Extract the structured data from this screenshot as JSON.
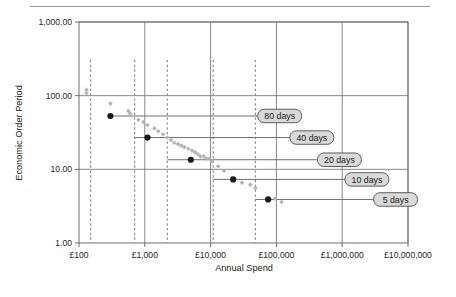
{
  "figure": {
    "name": "economic-order-period-chart",
    "top_rule": true,
    "background": "#ffffff"
  },
  "chart_data": {
    "type": "scatter",
    "title": "",
    "xlabel": "Annual Spend",
    "ylabel": "Economic Order Period",
    "xscale": "log",
    "yscale": "log",
    "xlim": [
      100,
      10000000
    ],
    "ylim": [
      1,
      1000
    ],
    "grid": true,
    "legend": "none",
    "xticks": [
      100,
      1000,
      10000,
      100000,
      1000000,
      10000000
    ],
    "xticklabels": [
      "£100",
      "£1,000",
      "£10,000",
      "£100,000",
      "£1,000,000",
      "£10,000,000"
    ],
    "yticks": [
      1,
      10,
      100,
      1000
    ],
    "yticklabels": [
      "1.00",
      "10.00",
      "100.00",
      "1,000.00"
    ],
    "series": [
      {
        "name": "Item scatter (grey diamonds)",
        "marker": "diamond",
        "color": "#b3b3b3",
        "points": [
          [
            130,
            120
          ],
          [
            130,
            108
          ],
          [
            300,
            78
          ],
          [
            560,
            62
          ],
          [
            600,
            57
          ],
          [
            800,
            47
          ],
          [
            950,
            44
          ],
          [
            1100,
            40
          ],
          [
            1400,
            36
          ],
          [
            1600,
            33
          ],
          [
            1900,
            30
          ],
          [
            2200,
            27
          ],
          [
            2500,
            25
          ],
          [
            2800,
            23
          ],
          [
            3200,
            22
          ],
          [
            3600,
            21
          ],
          [
            4000,
            20
          ],
          [
            4600,
            19
          ],
          [
            5200,
            18
          ],
          [
            5800,
            17
          ],
          [
            6400,
            16
          ],
          [
            7000,
            15
          ],
          [
            7800,
            15
          ],
          [
            8600,
            14
          ],
          [
            9500,
            14
          ],
          [
            10500,
            13
          ],
          [
            13000,
            11
          ],
          [
            16000,
            9.6
          ],
          [
            30000,
            6.6
          ],
          [
            40000,
            6.2
          ],
          [
            48000,
            5.6
          ],
          [
            95000,
            4.0
          ],
          [
            120000,
            3.6
          ]
        ]
      },
      {
        "name": "Break-point markers (black circles)",
        "marker": "circle",
        "color": "#1a1a1a",
        "points": [
          [
            300,
            53
          ],
          [
            1100,
            27
          ],
          [
            5000,
            13.5
          ],
          [
            22000,
            7.3
          ],
          [
            75000,
            3.9
          ]
        ]
      }
    ],
    "callouts": [
      {
        "label": "80 days",
        "y_value": 53,
        "leader_from_x": 300,
        "leader_to_x": 52000
      },
      {
        "label": "40 days",
        "y_value": 27,
        "leader_from_x": 700,
        "leader_to_x": 160000
      },
      {
        "label": "20 days",
        "y_value": 13.5,
        "leader_from_x": 2200,
        "leader_to_x": 420000
      },
      {
        "label": "10 days",
        "y_value": 7.3,
        "leader_from_x": 11000,
        "leader_to_x": 1100000
      },
      {
        "label": "5 days",
        "y_value": 3.9,
        "leader_from_x": 48000,
        "leader_to_x": 3000000
      }
    ],
    "threshold_lines": [
      {
        "x_value": 150,
        "label": ""
      },
      {
        "x_value": 700,
        "label": ""
      },
      {
        "x_value": 2200,
        "label": ""
      },
      {
        "x_value": 11000,
        "label": ""
      },
      {
        "x_value": 48000,
        "label": ""
      }
    ],
    "colors": {
      "axis": "#6f6f6f",
      "grid": "#7a7a7a",
      "scatter": "#b3b3b3",
      "marker": "#1a1a1a",
      "leader": "#6f6f6f",
      "pill_fill": "#d9d9d9",
      "pill_stroke": "#4d4d4d",
      "dashed": "#8c8c8c",
      "text": "#231f20",
      "rule": "#9a9a9a"
    }
  }
}
